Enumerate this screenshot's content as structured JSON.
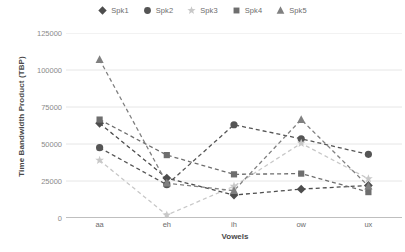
{
  "chart_data": {
    "type": "line",
    "title": "",
    "xlabel": "Vowels",
    "ylabel": "Time Bandwidth Product (TBP)",
    "categories": [
      "aa",
      "eh",
      "ih",
      "ow",
      "ux"
    ],
    "ylim": [
      0,
      125000
    ],
    "yticks": [
      0,
      25000,
      50000,
      75000,
      100000,
      125000
    ],
    "ytick_labels": [
      "0",
      "25000",
      "50000",
      "75000",
      "100000",
      "125000"
    ],
    "grid": true,
    "legend_position": "top-center",
    "line_style": "dashed",
    "series": [
      {
        "name": "Spk1",
        "marker": "diamond",
        "color": "#4d4d4d",
        "values": [
          64000,
          27000,
          15500,
          19500,
          22000
        ]
      },
      {
        "name": "Spk2",
        "marker": "circle",
        "color": "#555555",
        "values": [
          47500,
          22500,
          63000,
          53500,
          43000
        ]
      },
      {
        "name": "Spk3",
        "marker": "star",
        "color": "#c8c8c8",
        "values": [
          39000,
          2000,
          21500,
          50500,
          26500
        ]
      },
      {
        "name": "Spk4",
        "marker": "square",
        "color": "#6e6e6e",
        "values": [
          66500,
          42500,
          29500,
          30000,
          17500
        ]
      },
      {
        "name": "Spk5",
        "marker": "triangle",
        "color": "#808080",
        "values": [
          107000,
          23500,
          18500,
          66500,
          21500
        ]
      }
    ]
  },
  "legend": {
    "items": [
      {
        "label": "Spk1"
      },
      {
        "label": "Spk2"
      },
      {
        "label": "Spk3"
      },
      {
        "label": "Spk4"
      },
      {
        "label": "Spk5"
      }
    ]
  },
  "axes": {
    "y_title": "Time Bandwidth Product (TBP)",
    "x_title": "Vowels"
  },
  "colors": {
    "grid": "#e6e6e6",
    "axis": "#808080",
    "tick_text": "#8a8a8a",
    "title_text": "#4a4a4a"
  }
}
